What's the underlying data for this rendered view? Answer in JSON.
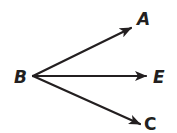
{
  "diagram": {
    "type": "rays-from-common-endpoint",
    "vertex": {
      "label": "B",
      "x": 33,
      "y": 76
    },
    "rays": [
      {
        "label": "A",
        "from": "B",
        "tip": {
          "x": 131,
          "y": 28
        }
      },
      {
        "label": "E",
        "from": "B",
        "tip": {
          "x": 146,
          "y": 76
        }
      },
      {
        "label": "C",
        "from": "B",
        "tip": {
          "x": 140,
          "y": 124
        }
      }
    ],
    "labels": {
      "B": "B",
      "A": "A",
      "E": "E",
      "C": "C"
    },
    "colors": {
      "stroke": "#231f20",
      "background": "#ffffff"
    }
  }
}
